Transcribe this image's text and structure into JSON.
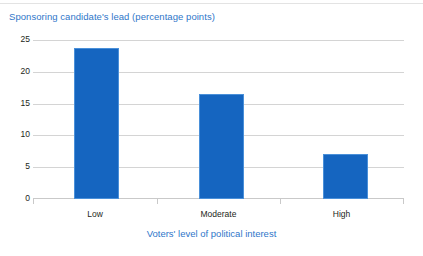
{
  "chart_data": {
    "type": "bar",
    "title": "Sponsoring candidate's lead (percentage points)",
    "xlabel": "Voters' level of political interest",
    "ylabel": "",
    "categories": [
      "Low",
      "Moderate",
      "High"
    ],
    "values": [
      23.7,
      16.5,
      7.0
    ],
    "series": [
      {
        "name": "Sponsoring candidate's lead",
        "values": [
          23.7,
          16.5,
          7.0
        ]
      }
    ],
    "ylim": [
      0,
      25
    ],
    "yticks": [
      0,
      5,
      10,
      15,
      20,
      25
    ],
    "ytick_labels": [
      "0",
      "5",
      "10",
      "15",
      "20",
      "25"
    ],
    "grid": true,
    "legend": false,
    "legend_position": "none",
    "bar_color": "#1565C0",
    "title_color": "#2F76C9",
    "axis_label_color": "#2F76C9",
    "gridline_color": "#D4D4D4",
    "tick_label_color": "#231F20",
    "background_color": "#FFFFFF"
  }
}
